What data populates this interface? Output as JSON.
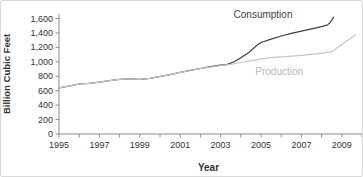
{
  "chart_data": {
    "type": "line",
    "title": "",
    "xlabel": "Year",
    "ylabel": "Billion Cubic Feet",
    "xlim": [
      1995,
      2010
    ],
    "ylim": [
      0,
      1600
    ],
    "grid": false,
    "legend_position": "inline-annotations",
    "x_major_ticks": {
      "values": [
        1995,
        1997,
        1999,
        2001,
        2003,
        2005,
        2007,
        2009
      ],
      "labels": [
        "1995",
        "1997",
        "1999",
        "2001",
        "2003",
        "2005",
        "2007",
        "2009"
      ]
    },
    "x_minor_ticks": [
      1995,
      1996,
      1997,
      1998,
      1999,
      2000,
      2001,
      2002,
      2003,
      2004,
      2005,
      2006,
      2007,
      2008,
      2009,
      2010
    ],
    "y_ticks": {
      "values": [
        0,
        200,
        400,
        600,
        800,
        1000,
        1200,
        1400,
        1600
      ],
      "labels": [
        "0",
        "200",
        "400",
        "600",
        "800",
        "1,000",
        "1,200",
        "1,400",
        "1,600"
      ]
    },
    "series": [
      {
        "name": "Consumption",
        "color": "#3f3f3f",
        "label_color": "#404040",
        "label_anchor": {
          "x": 2005.1,
          "y": 1610
        },
        "points": [
          [
            1995,
            640
          ],
          [
            1995.4,
            660
          ],
          [
            1996,
            692
          ],
          [
            1996.5,
            703
          ],
          [
            1997,
            718
          ],
          [
            1997.5,
            740
          ],
          [
            1998,
            757
          ],
          [
            1998.5,
            763
          ],
          [
            1999,
            758
          ],
          [
            1999.5,
            770
          ],
          [
            2000,
            797
          ],
          [
            2000.5,
            823
          ],
          [
            2001,
            853
          ],
          [
            2001.5,
            882
          ],
          [
            2002,
            908
          ],
          [
            2002.5,
            933
          ],
          [
            2003,
            953
          ],
          [
            2003.3,
            962
          ],
          [
            2003.7,
            1005
          ],
          [
            2004,
            1055
          ],
          [
            2004.4,
            1130
          ],
          [
            2004.8,
            1230
          ],
          [
            2005,
            1268
          ],
          [
            2005.5,
            1315
          ],
          [
            2006,
            1357
          ],
          [
            2006.5,
            1393
          ],
          [
            2007,
            1424
          ],
          [
            2007.5,
            1456
          ],
          [
            2008,
            1488
          ],
          [
            2008.3,
            1512
          ],
          [
            2008.45,
            1555
          ],
          [
            2008.6,
            1620
          ]
        ]
      },
      {
        "name": "Production",
        "color": "#c6c6c6",
        "label_color": "#b8b8b8",
        "label_anchor": {
          "x": 2005.9,
          "y": 820
        },
        "points": [
          [
            1995,
            640
          ],
          [
            1995.4,
            660
          ],
          [
            1996,
            692
          ],
          [
            1996.5,
            703
          ],
          [
            1997,
            718
          ],
          [
            1997.5,
            740
          ],
          [
            1998,
            757
          ],
          [
            1998.5,
            763
          ],
          [
            1999,
            758
          ],
          [
            1999.5,
            770
          ],
          [
            2000,
            797
          ],
          [
            2000.5,
            823
          ],
          [
            2001,
            853
          ],
          [
            2001.5,
            880
          ],
          [
            2002,
            905
          ],
          [
            2002.5,
            928
          ],
          [
            2003,
            948
          ],
          [
            2003.5,
            966
          ],
          [
            2004,
            990
          ],
          [
            2004.5,
            1014
          ],
          [
            2005,
            1040
          ],
          [
            2005.5,
            1057
          ],
          [
            2006,
            1068
          ],
          [
            2006.5,
            1079
          ],
          [
            2007,
            1090
          ],
          [
            2007.5,
            1103
          ],
          [
            2008,
            1117
          ],
          [
            2008.5,
            1140
          ],
          [
            2009,
            1240
          ],
          [
            2009.35,
            1310
          ],
          [
            2009.7,
            1380
          ]
        ]
      }
    ],
    "style": {
      "axis_color": "#8c8c8c",
      "tick_label_color": "#333333",
      "axis_title_color": "#333333"
    }
  }
}
